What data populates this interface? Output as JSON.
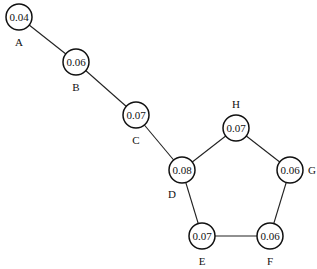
{
  "diagram": {
    "type": "graph",
    "node_radius": 13,
    "nodes": [
      {
        "id": "A",
        "label": "A",
        "value": "0.04",
        "x": 19,
        "y": 17,
        "lx": 19,
        "ly": 42
      },
      {
        "id": "B",
        "label": "B",
        "value": "0.06",
        "x": 76,
        "y": 62,
        "lx": 76,
        "ly": 87
      },
      {
        "id": "C",
        "label": "C",
        "value": "0.07",
        "x": 136,
        "y": 115,
        "lx": 136,
        "ly": 140
      },
      {
        "id": "D",
        "label": "D",
        "value": "0.08",
        "x": 182,
        "y": 170,
        "lx": 172,
        "ly": 194
      },
      {
        "id": "E",
        "label": "E",
        "value": "0.07",
        "x": 202,
        "y": 236,
        "lx": 202,
        "ly": 261
      },
      {
        "id": "F",
        "label": "F",
        "value": "0.06",
        "x": 270,
        "y": 236,
        "lx": 270,
        "ly": 261
      },
      {
        "id": "G",
        "label": "G",
        "value": "0.06",
        "x": 290,
        "y": 170,
        "lx": 312,
        "ly": 170
      },
      {
        "id": "H",
        "label": "H",
        "value": "0.07",
        "x": 236,
        "y": 128,
        "lx": 236,
        "ly": 104
      }
    ],
    "edges": [
      [
        "A",
        "B"
      ],
      [
        "B",
        "C"
      ],
      [
        "C",
        "D"
      ],
      [
        "D",
        "H"
      ],
      [
        "H",
        "G"
      ],
      [
        "G",
        "F"
      ],
      [
        "F",
        "E"
      ],
      [
        "E",
        "D"
      ]
    ]
  }
}
